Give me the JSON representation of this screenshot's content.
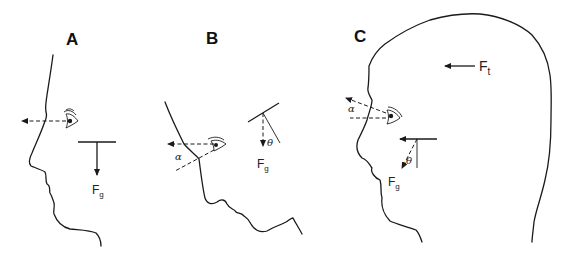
{
  "figure": {
    "panels": [
      {
        "id": "A",
        "label": "A",
        "force_label": "F",
        "force_subscript": "g",
        "description": "Upright head profile, gaze horizontal, gravity vector straight down"
      },
      {
        "id": "B",
        "label": "B",
        "force_label": "F",
        "force_subscript": "g",
        "angle_gaze": "α",
        "angle_tilt": "θ",
        "description": "Head tilted back, gaze horizontal, gravity vector at angle θ to head axis"
      },
      {
        "id": "C",
        "label": "C",
        "force_label": "F",
        "force_subscript": "g",
        "translational_force_label": "F",
        "translational_force_subscript": "t",
        "angle_gaze": "α",
        "angle_tilt": "θ",
        "description": "Upright head under linear acceleration; resultant gravito-inertial force tilted by θ, gaze raised by α"
      }
    ]
  }
}
